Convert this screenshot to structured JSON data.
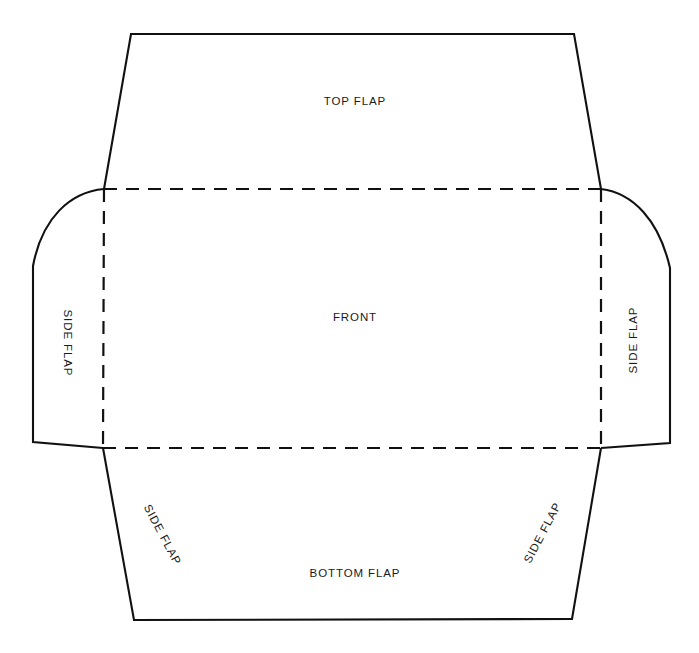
{
  "diagram": {
    "type": "packaging-dieline",
    "background_color": "#ffffff",
    "cut_line_color": "#111111",
    "fold_line_color": "#111111",
    "text_color": "#1a1a1a",
    "labels": {
      "top_flap": "TOP FLAP",
      "front": "FRONT",
      "bottom_flap": "BOTTOM FLAP",
      "side_flap_left": "SIDE FLAP",
      "side_flap_right": "SIDE FLAP",
      "side_flap_bottom_left": "SIDE FLAP",
      "side_flap_bottom_right": "SIDE FLAP"
    },
    "geometry": {
      "fold_rect": {
        "left": 104,
        "right": 601,
        "top": 189,
        "bottom": 448
      },
      "top_flap_outline": "M 104 189 L 131 34 L 574 34 L 601 189",
      "bottom_flap_outline": "M 103 448 L 134 620 L 572 619 L 601 448",
      "left_flap_outline": "M 104 189 C 70 192 42 218 33 266 L 33 442 L 103 448",
      "right_flap_outline": "M 601 189 C 633 193 659 220 670 268 L 670 443 L 601 448",
      "fold_top": "M 104 189 L 601 189",
      "fold_bottom": "M 103 448 L 601 448",
      "fold_left": "M 104 189 L 103 448",
      "fold_right": "M 601 189 L 601 448",
      "dash_pattern": "13 9",
      "cut_stroke_width": 2.1,
      "fold_stroke_width": 2.2
    }
  }
}
